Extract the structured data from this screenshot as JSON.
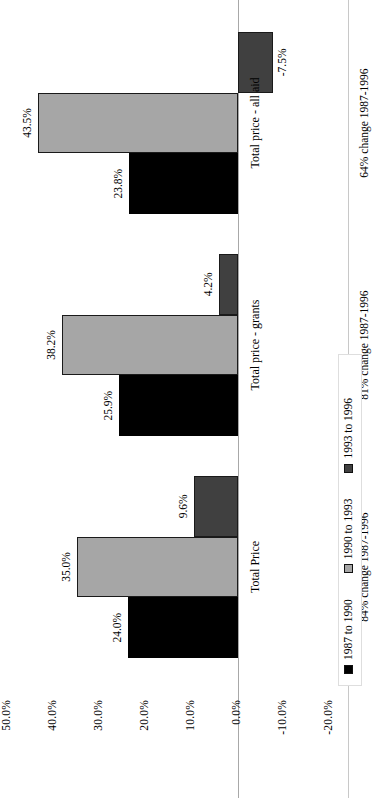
{
  "chart_data": {
    "type": "bar",
    "title": "",
    "xlabel": "",
    "ylabel": "",
    "orientation": "vertical-rotated-90ccw",
    "grid": false,
    "legend_position": "top-left",
    "ylim": [
      -20.0,
      50.0
    ],
    "ytick_step": 10.0,
    "yticks": [
      "50.0%",
      "40.0%",
      "30.0%",
      "20.0%",
      "10.0%",
      "0.0%",
      "-10.0%",
      "-20.0%"
    ],
    "ytick_values": [
      50.0,
      40.0,
      30.0,
      20.0,
      10.0,
      0.0,
      -10.0,
      -20.0
    ],
    "categories": [
      "Total Price",
      "Total price - grants",
      "Total price - all aid"
    ],
    "annotations": [
      "84% change 1987-1996",
      "81% change 1987-1996",
      "64% change 1987-1996"
    ],
    "series": [
      {
        "name": "1987 to 1990",
        "color": "#000000",
        "values": [
          24.0,
          25.9,
          23.8
        ],
        "labels": [
          "24.0%",
          "25.9%",
          "23.8%"
        ]
      },
      {
        "name": "1990 to 1993",
        "color": "#A6A6A6",
        "values": [
          35.0,
          38.2,
          43.5
        ],
        "labels": [
          "35.0%",
          "38.2%",
          "43.5%"
        ]
      },
      {
        "name": "1993 to 1996",
        "color": "#404040",
        "values": [
          9.6,
          4.2,
          -7.5
        ],
        "labels": [
          "9.6%",
          "4.2%",
          "-7.5%"
        ]
      }
    ]
  }
}
